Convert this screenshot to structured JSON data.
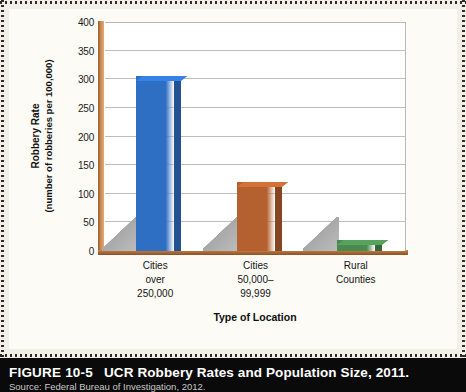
{
  "figure": {
    "number": "FIGURE 10-5",
    "title": "UCR Robbery Rates and Population Size, 2011.",
    "source": "Source: Federal Bureau of Investigation, 2012."
  },
  "colors": {
    "bar_blue": "#2e6fc4",
    "bar_orange": "#b4602f",
    "bar_green": "#4a8a50",
    "axis_brown": "#a4622f",
    "page_background": "#f2f0e6",
    "plot_background": "#ffffff",
    "caption_background": "#0a0a0a",
    "gridline": "#bdbdbd"
  },
  "chart_data": {
    "type": "bar",
    "title": "UCR Robbery Rates and Population Size, 2011.",
    "subtitle": "",
    "xlabel": "Type of Location",
    "ylabel": "Robbery Rate (number of robberies per 100,000)",
    "ylabel_line1": "Robbery Rate",
    "ylabel_line2": "(number of robberies per 100,000)",
    "categories": [
      "Cities over 250,000",
      "Cities 50,000–99,999",
      "Rural Counties"
    ],
    "category_lines": [
      [
        "Cities",
        "over",
        "250,000"
      ],
      [
        "Cities",
        "50,000–",
        "99,999"
      ],
      [
        "Rural",
        "Counties"
      ]
    ],
    "values": [
      305,
      120,
      20
    ],
    "bar_colors": [
      "#2e6fc4",
      "#b4602f",
      "#4a8a50"
    ],
    "ylim": [
      0,
      400
    ],
    "ytick_step": 50,
    "yticks": [
      0,
      50,
      100,
      150,
      200,
      250,
      300,
      350,
      400
    ],
    "ytick_labels": [
      "0",
      "50",
      "100",
      "150",
      "200",
      "250",
      "300",
      "350",
      "400"
    ],
    "grid": true,
    "legend": false,
    "legend_position": "none",
    "style": "3d-column"
  }
}
